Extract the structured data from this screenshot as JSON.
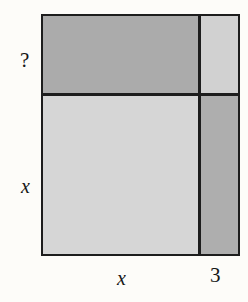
{
  "diagram": {
    "type": "area-model-rectangle",
    "caption_text": "?",
    "regions": [
      {
        "id": "top-left",
        "name": "top-left-region",
        "width_label": "x",
        "height_label": "?",
        "fill": "#ababab",
        "shade": "dark"
      },
      {
        "id": "top-right",
        "name": "top-right-region",
        "width_label": "3",
        "height_label": "?",
        "fill": "#d1d1d1",
        "shade": "light"
      },
      {
        "id": "bottom-left",
        "name": "bottom-left-region",
        "width_label": "x",
        "height_label": "x",
        "fill": "#d6d6d6",
        "shade": "light"
      },
      {
        "id": "bottom-right",
        "name": "bottom-right-region",
        "width_label": "3",
        "height_label": "x",
        "fill": "#aeaeae",
        "shade": "dark"
      }
    ],
    "labels": {
      "left_top": "?",
      "left_bottom": "x",
      "bottom_left": "x",
      "bottom_right": "3"
    },
    "colors": {
      "outline": "#1d1d1d",
      "background": "#fdfcf9",
      "text": "#161616",
      "fill_dark": "#ababab",
      "fill_light": "#d6d6d6",
      "fill_light_alt": "#d1d1d1",
      "fill_mid": "#aeaeae"
    }
  }
}
